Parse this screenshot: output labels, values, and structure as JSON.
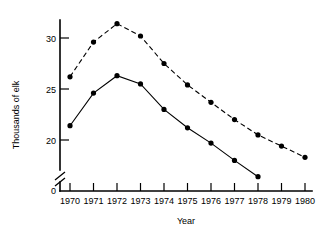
{
  "chart_data": {
    "type": "line",
    "title": "",
    "subtitle": "",
    "xlabel": "Year",
    "ylabel": "Thousands of elk",
    "categories": [
      "1970",
      "1971",
      "1972",
      "1973",
      "1974",
      "1975",
      "1976",
      "1977",
      "1978",
      "1979",
      "1980"
    ],
    "x": [
      1970,
      1971,
      1972,
      1973,
      1974,
      1975,
      1976,
      1977,
      1978,
      1979,
      1980
    ],
    "xlim": [
      1970,
      1980
    ],
    "ylim": [
      15.5,
      32.5
    ],
    "y_ticks": [
      0,
      20,
      25,
      30
    ],
    "y_tick_labels": [
      "0",
      "20",
      "25",
      "30"
    ],
    "y_axis_break": true,
    "y_axis_break_between": [
      0,
      20
    ],
    "grid": false,
    "legend": "none",
    "series": [
      {
        "name": "upper-dashed",
        "style": "dashed",
        "marker": "filled-circle",
        "x": [
          1970,
          1971,
          1972,
          1973,
          1974,
          1975,
          1976,
          1977,
          1978,
          1979,
          1980
        ],
        "values": [
          26.2,
          29.6,
          31.4,
          30.2,
          27.5,
          25.4,
          23.7,
          22.0,
          20.5,
          19.4,
          18.3
        ]
      },
      {
        "name": "lower-solid",
        "style": "solid",
        "marker": "filled-circle",
        "x": [
          1970,
          1971,
          1972,
          1973,
          1974,
          1975,
          1976,
          1977,
          1978
        ],
        "values": [
          21.4,
          24.6,
          26.3,
          25.5,
          23.0,
          21.2,
          19.7,
          18.0,
          16.4
        ]
      }
    ]
  },
  "axes": {
    "y_title": "Thousands of elk",
    "x_title": "Year",
    "y_labels": [
      "30",
      "25",
      "20",
      "0"
    ],
    "x_labels": [
      "1970",
      "1971",
      "1972",
      "1973",
      "1974",
      "1975",
      "1976",
      "1977",
      "1978",
      "1979",
      "1980"
    ]
  },
  "colors": {
    "ink": "#000000",
    "background": "#ffffff"
  }
}
